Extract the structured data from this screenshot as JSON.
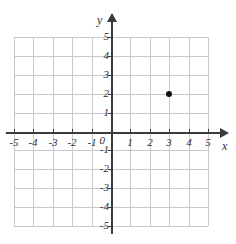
{
  "top_artifact_text": "·· ···· ·· ·· ···",
  "chart_data": {
    "type": "scatter",
    "title": "",
    "xlabel": "x",
    "ylabel": "y",
    "xlim": [
      -5,
      5
    ],
    "ylim": [
      -5,
      5
    ],
    "grid": true,
    "legend": "none",
    "x_tick_labels": [
      "-5",
      "-4",
      "-3",
      "-2",
      "-1",
      "0",
      "1",
      "2",
      "3",
      "4",
      "5"
    ],
    "y_tick_labels": [
      "5",
      "4",
      "3",
      "2",
      "1",
      "0",
      "-1",
      "-2",
      "-3",
      "-4",
      "-5"
    ],
    "origin_label": "0",
    "points": [
      {
        "label": "plotted-point",
        "x": 3,
        "y": 2
      }
    ],
    "colors": {
      "grid": "#c9c9cd",
      "axis": "#3b3b3f",
      "point": "#111114",
      "text": "#2e2e33",
      "background": "#ffffff"
    }
  }
}
